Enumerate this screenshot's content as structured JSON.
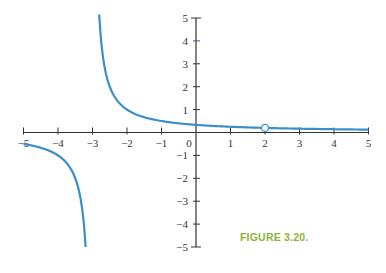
{
  "caption": "FIGURE 3.20.",
  "colors": {
    "curve": "#3a8fc8",
    "axis": "#333333",
    "caption": "#8cb23a"
  },
  "chart_data": {
    "type": "line",
    "title": "",
    "caption": "FIGURE 3.20.",
    "function": "y = 1/(x+3), with hole at x = 2",
    "xlabel": "",
    "ylabel": "",
    "xlim": [
      -5,
      5
    ],
    "ylim": [
      -5,
      5
    ],
    "x_ticks": [
      -5,
      -4,
      -3,
      -2,
      -1,
      0,
      1,
      2,
      3,
      4,
      5
    ],
    "y_ticks": [
      -5,
      -4,
      -3,
      -2,
      -1,
      1,
      2,
      3,
      4,
      5
    ],
    "vertical_asymptote": -3,
    "horizontal_asymptote": 0,
    "series": [
      {
        "name": "left branch",
        "x": [
          -5,
          -4.5,
          -4,
          -3.75,
          -3.5,
          -3.4,
          -3.3,
          -3.25,
          -3.2
        ],
        "y": [
          -0.5,
          -0.667,
          -1,
          -1.333,
          -2,
          -2.5,
          -3.333,
          -4,
          -5
        ]
      },
      {
        "name": "right branch",
        "x": [
          -2.81,
          -2.75,
          -2.5,
          -2,
          -1,
          0,
          1,
          2,
          3,
          4,
          5
        ],
        "y": [
          5.3,
          4,
          2,
          1,
          0.5,
          0.333,
          0.25,
          0.2,
          0.167,
          0.143,
          0.125
        ]
      }
    ],
    "open_points": [
      {
        "x": 2,
        "y": 0.2
      }
    ],
    "grid": false,
    "legend": null
  }
}
